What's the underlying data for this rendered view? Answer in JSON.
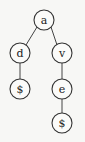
{
  "diagram": {
    "type": "tree",
    "nodes": [
      {
        "id": "n_a",
        "label": "a",
        "x": 44,
        "y": 20
      },
      {
        "id": "n_d",
        "label": "d",
        "x": 20,
        "y": 53
      },
      {
        "id": "n_v",
        "label": "v",
        "x": 62,
        "y": 53
      },
      {
        "id": "n_d_end",
        "label": "$",
        "x": 20,
        "y": 89
      },
      {
        "id": "n_e",
        "label": "e",
        "x": 62,
        "y": 89
      },
      {
        "id": "n_e_end",
        "label": "$",
        "x": 62,
        "y": 123
      }
    ],
    "edges": [
      {
        "from": "n_a",
        "to": "n_d"
      },
      {
        "from": "n_a",
        "to": "n_v"
      },
      {
        "from": "n_d",
        "to": "n_d_end"
      },
      {
        "from": "n_v",
        "to": "n_e"
      },
      {
        "from": "n_e",
        "to": "n_e_end"
      }
    ]
  }
}
